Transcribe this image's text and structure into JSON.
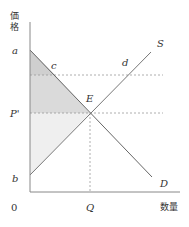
{
  "diagram": {
    "type": "supply-demand",
    "axes": {
      "y_label": "価格",
      "y_label_chars": [
        "価",
        "格"
      ],
      "x_label": "数量",
      "origin": "0"
    },
    "curves": [
      {
        "name": "S",
        "label": "S",
        "kind": "supply",
        "from_label": "b"
      },
      {
        "name": "D",
        "label": "D",
        "kind": "demand",
        "from_label": "a"
      }
    ],
    "points": {
      "a": "a",
      "b": "b",
      "c": "c",
      "d": "d",
      "E": "E",
      "P_prime": "P'",
      "Q": "Q"
    },
    "shading": [
      {
        "region": "triangle a-c-E-P' (consumer surplus, upper part darker)",
        "color": "#d4d4d4"
      },
      {
        "region": "triangle P'-E-b (producer surplus)",
        "color": "#f0f0f0"
      }
    ],
    "colors": {
      "axis": "#888888",
      "curve": "#777777",
      "dashed": "#999999",
      "shade_dark": "#cfcfcf",
      "shade_light": "#ededed"
    }
  }
}
